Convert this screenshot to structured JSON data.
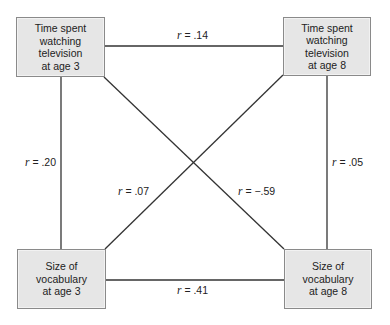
{
  "diagram": {
    "type": "cross-lagged correlation diagram",
    "nodes": {
      "tv3": {
        "label": "Time spent\nwatching\ntelevision\nat age 3"
      },
      "tv8": {
        "label": "Time spent\nwatching\ntelevision\nat age 8"
      },
      "vocab3": {
        "label": "Size of\nvocabulary\nat age 3"
      },
      "vocab8": {
        "label": "Size of\nvocabulary\nat age 8"
      }
    },
    "edges": [
      {
        "from": "tv3",
        "to": "tv8",
        "symbol": "r",
        "value": "= .14"
      },
      {
        "from": "tv3",
        "to": "vocab3",
        "symbol": "r",
        "value": "= .20"
      },
      {
        "from": "tv8",
        "to": "vocab8",
        "symbol": "r",
        "value": "= .05"
      },
      {
        "from": "vocab3",
        "to": "tv8",
        "symbol": "r",
        "value": "= .07"
      },
      {
        "from": "tv3",
        "to": "vocab8",
        "symbol": "r",
        "value": "= −.59"
      },
      {
        "from": "vocab3",
        "to": "vocab8",
        "symbol": "r",
        "value": "= .41"
      }
    ],
    "colors": {
      "box_fill": "#e6e6e6",
      "box_border": "#8a8a8a",
      "line": "#333333"
    }
  }
}
